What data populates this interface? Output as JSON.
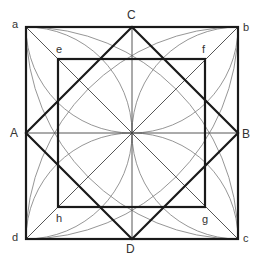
{
  "diagram": {
    "type": "geometric-construction",
    "outer_square": {
      "corners": [
        "a",
        "b",
        "c",
        "d"
      ]
    },
    "rotated_square": {
      "vertices": [
        "C",
        "B",
        "D",
        "A"
      ]
    },
    "inner_square": {
      "corners": [
        "e",
        "f",
        "g",
        "h"
      ]
    },
    "labels": {
      "a": "a",
      "b": "b",
      "c": "c",
      "d": "d",
      "A": "A",
      "B": "B",
      "C": "C",
      "D": "D",
      "e": "e",
      "f": "f",
      "g": "g",
      "h": "h"
    },
    "colors": {
      "heavy": "#1a1a1a",
      "light": "#555555",
      "arc": "#888888"
    }
  }
}
